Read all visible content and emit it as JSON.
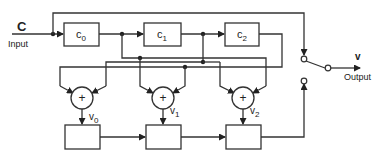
{
  "diagram": {
    "input": {
      "symbol": "C",
      "label": "Input"
    },
    "output": {
      "symbol": "v",
      "label": "Output"
    },
    "registers": [
      {
        "name": "c",
        "sub": "0"
      },
      {
        "name": "c",
        "sub": "1"
      },
      {
        "name": "c",
        "sub": "2"
      }
    ],
    "adders": [
      {
        "symbol": "+",
        "out_name": "v",
        "out_sub": "0"
      },
      {
        "symbol": "+",
        "out_name": "v",
        "out_sub": "1"
      },
      {
        "symbol": "+",
        "out_name": "v",
        "out_sub": "2"
      }
    ],
    "colors": {
      "line": "#333333",
      "background": "#ffffff"
    }
  }
}
